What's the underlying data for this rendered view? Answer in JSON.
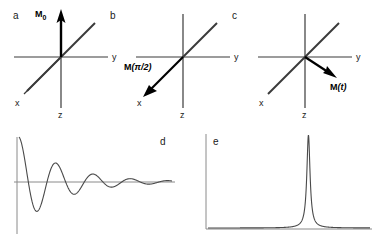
{
  "figure": {
    "stroke_color": "#3a3a3a",
    "vector_color": "#000000",
    "curve_color": "#4a4a4a",
    "background": "#ffffff"
  },
  "panels": [
    {
      "id": "a",
      "letter": "a",
      "axes": {
        "x": "x",
        "y": "y",
        "z": "z"
      },
      "vector": {
        "label_main": "M",
        "label_sub": "0",
        "label_full": "M0",
        "direction": "up-vertical",
        "description": "equilibrium magnetization along -z (drawn upward)"
      }
    },
    {
      "id": "b",
      "letter": "b",
      "axes": {
        "x": "x",
        "y": "y",
        "z": "z"
      },
      "vector": {
        "label_main": "M",
        "label_arg": "(π/2)",
        "label_full": "M(π/2)",
        "direction": "down-left-along-x",
        "description": "magnetization after a 90 degree pulse, along x"
      }
    },
    {
      "id": "c",
      "letter": "c",
      "axes": {
        "x": "x",
        "y": "y",
        "z": "z"
      },
      "vector": {
        "label_main": "M",
        "label_arg": "(t)",
        "label_full": "M(t)",
        "direction": "down-right-toward-y",
        "description": "magnetization precessing at time t"
      }
    },
    {
      "id": "d",
      "letter": "d",
      "plot_type": "free-induction-decay",
      "description": "damped oscillating signal decaying to baseline"
    },
    {
      "id": "e",
      "letter": "e",
      "plot_type": "lorentzian-spectrum",
      "description": "single sharp absorption peak after Fourier transform"
    }
  ],
  "chart_data": [
    {
      "type": "line",
      "id": "d",
      "title": "",
      "xlabel": "",
      "ylabel": "",
      "description": "Free induction decay: exponentially damped cosine",
      "grid": false,
      "legend": null,
      "axes_drawn": [
        "vertical-left",
        "horizontal-baseline"
      ],
      "function": "A*exp(-t/T2)*cos(2*pi*f*t)",
      "amplitude": 1.0,
      "decay_constant_T2": 0.28,
      "frequency": 4.1,
      "xlim": [
        0,
        1
      ],
      "ylim": [
        -1,
        1
      ],
      "x": [
        0,
        0.02,
        0.04,
        0.06,
        0.08,
        0.1,
        0.12,
        0.14,
        0.16,
        0.18,
        0.2,
        0.25,
        0.3,
        0.35,
        0.4,
        0.45,
        0.5,
        0.55,
        0.6,
        0.65,
        0.7,
        0.75,
        0.8,
        0.85,
        0.9,
        0.95,
        1.0
      ],
      "y": [
        1.0,
        0.79,
        0.4,
        -0.05,
        -0.45,
        -0.7,
        -0.76,
        -0.63,
        -0.36,
        -0.04,
        0.27,
        0.54,
        0.2,
        -0.3,
        -0.34,
        0.02,
        0.28,
        0.16,
        -0.12,
        -0.2,
        -0.02,
        0.14,
        0.1,
        -0.04,
        -0.1,
        -0.03,
        0.04
      ]
    },
    {
      "type": "line",
      "id": "e",
      "title": "",
      "xlabel": "",
      "ylabel": "",
      "description": "Lorentzian absorption lineshape, single narrow peak",
      "grid": false,
      "legend": null,
      "axes_drawn": [
        "vertical-left",
        "horizontal-baseline"
      ],
      "function": "A/(1+((x-x0)/w)^2)",
      "peak_center": 0.62,
      "peak_height": 1.0,
      "half_width": 0.012,
      "xlim": [
        0,
        1
      ],
      "ylim": [
        0,
        1
      ],
      "x": [
        0,
        0.1,
        0.2,
        0.3,
        0.4,
        0.45,
        0.5,
        0.54,
        0.57,
        0.59,
        0.6,
        0.61,
        0.62,
        0.63,
        0.64,
        0.65,
        0.67,
        0.7,
        0.74,
        0.8,
        0.9,
        1.0
      ],
      "y": [
        0.0003,
        0.0004,
        0.0006,
        0.001,
        0.002,
        0.004,
        0.01,
        0.02,
        0.05,
        0.18,
        0.4,
        0.78,
        1.0,
        0.78,
        0.4,
        0.18,
        0.05,
        0.02,
        0.008,
        0.003,
        0.001,
        0.0005
      ]
    }
  ]
}
